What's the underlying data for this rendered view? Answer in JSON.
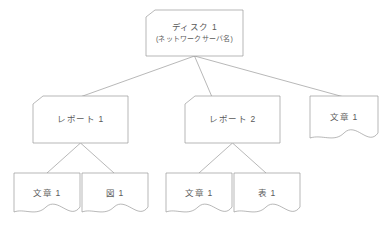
{
  "diagram": {
    "type": "tree",
    "title": "",
    "background_color": "#ffffff",
    "line_color": "#9a9a9a",
    "text_color": "#5a5a5a",
    "nodes": [
      {
        "id": "root",
        "label": "ディスク 1",
        "sublabel": "(ネットワークサーバ名)",
        "shape": "folder",
        "level": 0
      },
      {
        "id": "report1",
        "label": "レポート 1",
        "shape": "folder",
        "level": 1
      },
      {
        "id": "report2",
        "label": "レポート 2",
        "shape": "folder",
        "level": 1
      },
      {
        "id": "doc-top",
        "label": "文章 1",
        "shape": "document",
        "level": 1
      },
      {
        "id": "doc-r1",
        "label": "文章 1",
        "shape": "document",
        "level": 2
      },
      {
        "id": "fig-r1",
        "label": "図 1",
        "shape": "document",
        "level": 2
      },
      {
        "id": "doc-r2",
        "label": "文章 1",
        "shape": "document",
        "level": 2
      },
      {
        "id": "table-r2",
        "label": "表 1",
        "shape": "document",
        "level": 2
      }
    ],
    "edges": [
      {
        "from": "root",
        "to": "report1"
      },
      {
        "from": "root",
        "to": "report2"
      },
      {
        "from": "root",
        "to": "doc-top"
      },
      {
        "from": "report1",
        "to": "doc-r1"
      },
      {
        "from": "report1",
        "to": "fig-r1"
      },
      {
        "from": "report2",
        "to": "doc-r2"
      },
      {
        "from": "report2",
        "to": "table-r2"
      }
    ]
  }
}
